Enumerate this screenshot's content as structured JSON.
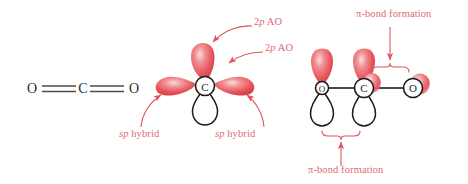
{
  "figure": {
    "background_color": "#ffffff",
    "label_color": "#e06a72",
    "orbital_red": "#e8555b",
    "orbital_red_dark": "#d23a42",
    "orbital_highlight": "#f8c9cb",
    "outline_color": "#1a1a1a",
    "bond_color": "#4a4a4a"
  },
  "panels": {
    "lewis": {
      "name": "Lewis structure of carbon dioxide",
      "atoms": [
        "O",
        "C",
        "O"
      ],
      "bonds": [
        "double",
        "double"
      ],
      "formula": "O=C=O"
    },
    "hybrid": {
      "name": "sp hybridized carbon atom",
      "center_atom": "C",
      "orbitals": [
        {
          "kind": "sp-hybrid",
          "direction": "left",
          "color": "red"
        },
        {
          "kind": "sp-hybrid",
          "direction": "right",
          "color": "red"
        },
        {
          "kind": "2p-AO",
          "direction": "up",
          "color": "red"
        },
        {
          "kind": "2p-AO",
          "direction": "down",
          "color": "white"
        }
      ]
    },
    "pibond": {
      "name": "pi bond formation in carbon dioxide",
      "atoms": [
        "O",
        "C",
        "O"
      ],
      "bond_type": "sigma"
    }
  },
  "labels": {
    "p_ao_upper": {
      "prefix": "2",
      "italic": "p",
      "suffix": " AO",
      "full": "2p AO"
    },
    "p_ao_lower": {
      "prefix": "2",
      "italic": "p",
      "suffix": " AO",
      "full": "2p AO"
    },
    "sp_hybrid_left": {
      "italic": "sp",
      "suffix": " hybrid",
      "full": "sp hybrid"
    },
    "sp_hybrid_right": {
      "italic": "sp",
      "suffix": " hybrid",
      "full": "sp hybrid"
    },
    "pi_bond_top": {
      "full": "π-bond formation"
    },
    "pi_bond_bottom": {
      "full": "π-bond formation"
    }
  },
  "atom_labels": {
    "lewis_o_left": "O",
    "lewis_c": "C",
    "lewis_o_right": "O",
    "hybrid_c": "C",
    "pi_o_left": "O",
    "pi_c": "C",
    "pi_o_right": "O"
  }
}
